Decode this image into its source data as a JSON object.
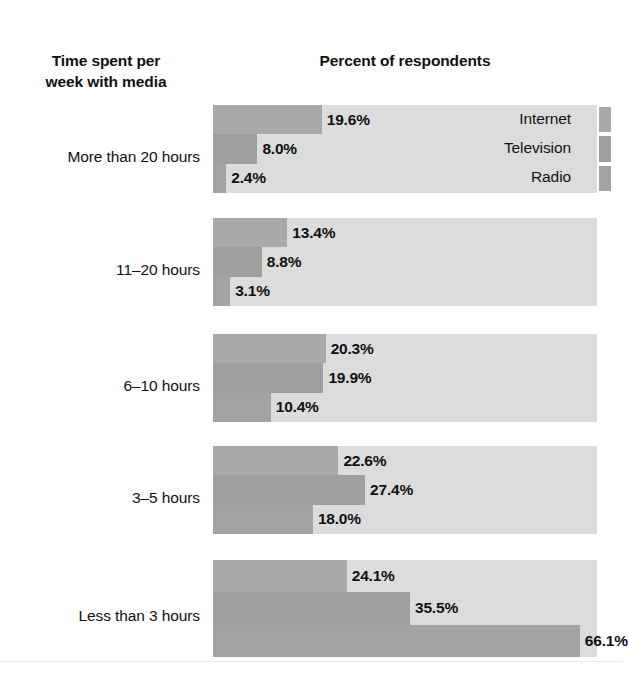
{
  "headers": {
    "left_title_line1": "Time spent per",
    "left_title_line2": "week with media",
    "right_title": "Percent of respondents"
  },
  "legend": {
    "items": [
      {
        "label": "Internet",
        "color": "#a9a9a9",
        "key_name": "legend-key-internet"
      },
      {
        "label": "Television",
        "color": "#9f9f9f",
        "key_name": "legend-key-television"
      },
      {
        "label": "Radio",
        "color": "#a3a3a3",
        "key_name": "legend-key-radio"
      }
    ]
  },
  "colors": {
    "bar": "#a9a9a9",
    "panel_background": "#dcdcdc",
    "page_background": "#ffffff",
    "text": "#111111"
  },
  "chart_data": {
    "type": "bar",
    "orientation": "horizontal",
    "title": "Percent of respondents",
    "xlabel": "Percent of respondents",
    "ylabel": "Time spent per week with media",
    "grid": false,
    "legend_position": "right-of-first-group",
    "xlim": [
      0,
      100
    ],
    "value_suffix": "%",
    "categories": [
      "More than 20 hours",
      "11–20 hours",
      "6–10 hours",
      "3–5 hours",
      "Less than 3 hours"
    ],
    "series": [
      {
        "name": "Internet",
        "values": [
          19.6,
          13.4,
          20.3,
          22.6,
          24.1
        ]
      },
      {
        "name": "Television",
        "values": [
          8.0,
          8.8,
          19.9,
          27.4,
          35.5
        ]
      },
      {
        "name": "Radio",
        "values": [
          2.4,
          3.1,
          10.4,
          18.0,
          66.1
        ]
      }
    ],
    "labels": [
      [
        "19.6%",
        "8.0%",
        "2.4%"
      ],
      [
        "13.4%",
        "8.8%",
        "3.1%"
      ],
      [
        "20.3%",
        "19.9%",
        "10.4%"
      ],
      [
        "22.6%",
        "27.4%",
        "18.0%"
      ],
      [
        "24.1%",
        "35.5%",
        "66.1%"
      ]
    ]
  },
  "groups": [
    {
      "label": "More than 20 hours",
      "top": 105,
      "panel_height": 88,
      "label_top": 148,
      "bars": [
        {
          "series": "Internet",
          "value": 19.6,
          "text": "19.6%"
        },
        {
          "series": "Television",
          "value": 8.0,
          "text": "8.0%"
        },
        {
          "series": "Radio",
          "value": 2.4,
          "text": "2.4%"
        }
      ]
    },
    {
      "label": "11–20 hours",
      "top": 218,
      "panel_height": 88,
      "label_top": 261,
      "bars": [
        {
          "series": "Internet",
          "value": 13.4,
          "text": "13.4%"
        },
        {
          "series": "Television",
          "value": 8.8,
          "text": "8.8%"
        },
        {
          "series": "Radio",
          "value": 3.1,
          "text": "3.1%"
        }
      ]
    },
    {
      "label": "6–10 hours",
      "top": 334,
      "panel_height": 88,
      "label_top": 377,
      "bars": [
        {
          "series": "Internet",
          "value": 20.3,
          "text": "20.3%"
        },
        {
          "series": "Television",
          "value": 19.9,
          "text": "19.9%"
        },
        {
          "series": "Radio",
          "value": 10.4,
          "text": "10.4%"
        }
      ]
    },
    {
      "label": "3–5 hours",
      "top": 446,
      "panel_height": 88,
      "label_top": 489,
      "bars": [
        {
          "series": "Internet",
          "value": 22.6,
          "text": "22.6%"
        },
        {
          "series": "Television",
          "value": 27.4,
          "text": "27.4%"
        },
        {
          "series": "Radio",
          "value": 18.0,
          "text": "18.0%"
        }
      ]
    },
    {
      "label": "Less than 3 hours",
      "top": 560,
      "panel_height": 97,
      "label_top": 607,
      "bars": [
        {
          "series": "Internet",
          "value": 24.1,
          "text": "24.1%"
        },
        {
          "series": "Television",
          "value": 35.5,
          "text": "35.5%"
        },
        {
          "series": "Radio",
          "value": 66.1,
          "text": "66.1%"
        }
      ]
    }
  ]
}
